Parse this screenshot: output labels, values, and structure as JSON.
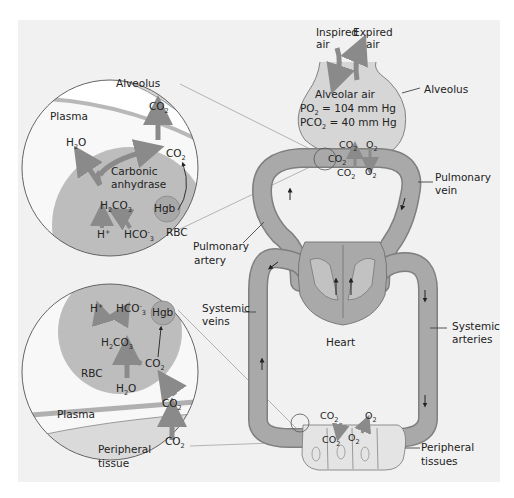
{
  "diagram": {
    "type": "gas-exchange-physiology",
    "colors": {
      "background": "#ffffff",
      "panel": "#f1f1f1",
      "vessel": "#a9a9a9",
      "vessel_outline": "#7a7a7a",
      "rbc": "#b5b5b5",
      "tissue": "#e6e6e6",
      "alveolus": "#d6d6d6",
      "arrow": "#8a8a8a",
      "text": "#222222"
    },
    "top_inset": {
      "alveolus": "Alveolus",
      "plasma": "Plasma",
      "co2_alveolus": "CO2",
      "co2_plasma": "CO2",
      "h2o": "H2O",
      "enzyme_line1": "Carbonic",
      "enzyme_line2": "anhydrase",
      "h2co3": "H2CO3",
      "hgb": "Hgb",
      "h_plus": "H+",
      "hco3": "HCO-3",
      "rbc": "RBC"
    },
    "bottom_inset": {
      "h_plus": "H+",
      "hco3": "HCO-3",
      "hgb": "Hgb",
      "h2co3": "H2CO3",
      "co2_rbc": "CO2",
      "rbc": "RBC",
      "h2o": "H2O",
      "co2_plasma": "CO2",
      "plasma": "Plasma",
      "co2_tissue": "CO2",
      "tissue_line1": "Peripheral",
      "tissue_line2": "tissue"
    },
    "lung": {
      "inspired_line1": "Inspired",
      "inspired_line2": "air",
      "expired_line1": "Expired",
      "expired_line2": "air",
      "alveolar_air": "Alveolar air",
      "po2": "PO2 = 104 mm Hg",
      "pco2": "PCO2 = 40 mm Hg",
      "alveolus_label": "Alveolus",
      "co2_up": "CO2",
      "o2_up": "O2",
      "co2_mid": "CO2",
      "co2_low": "CO2",
      "o2_low": "O2"
    },
    "labels": {
      "pulmonary_vein_1": "Pulmonary",
      "pulmonary_vein_2": "vein",
      "pulmonary_artery_1": "Pulmonary",
      "pulmonary_artery_2": "artery",
      "systemic_veins_1": "Systemic",
      "systemic_veins_2": "veins",
      "systemic_arteries_1": "Systemic",
      "systemic_arteries_2": "arteries",
      "heart": "Heart",
      "peripheral_tissues_1": "Peripheral",
      "peripheral_tissues_2": "tissues"
    },
    "capillary": {
      "co2_vessel": "CO2",
      "o2_vessel": "O2",
      "co2_tissue": "CO2",
      "o2_tissue": "O2"
    }
  }
}
